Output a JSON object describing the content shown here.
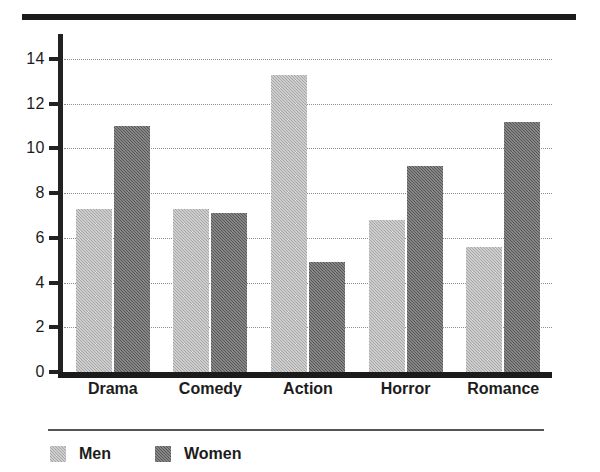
{
  "chart_data": {
    "type": "bar",
    "title": "",
    "xlabel": "",
    "ylabel": "",
    "categories": [
      "Drama",
      "Comedy",
      "Action",
      "Horror",
      "Romance"
    ],
    "series": [
      {
        "name": "Men",
        "color": "#a6a6a6",
        "values": [
          7.3,
          7.3,
          13.3,
          6.8,
          5.6
        ]
      },
      {
        "name": "Women",
        "color": "#575757",
        "values": [
          11.0,
          7.1,
          4.9,
          9.2,
          11.2
        ]
      }
    ],
    "ylim": [
      0,
      15
    ],
    "yticks": [
      0,
      2,
      4,
      6,
      8,
      10,
      12,
      14
    ],
    "ytick_labels": [
      "0",
      "2",
      "4",
      "6",
      "8",
      "10",
      "12",
      "14"
    ],
    "grid": true,
    "grid_style": "dotted",
    "grid_axis": "y",
    "legend_position": "bottom-left",
    "legend_entries": [
      "Men",
      "Women"
    ]
  },
  "decor": {
    "top_rule_color": "#1b1b1b",
    "axis_color": "#222222",
    "legend_rule_color": "#555555"
  }
}
